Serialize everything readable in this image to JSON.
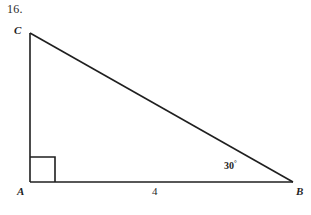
{
  "figure": {
    "problem_number": "16.",
    "background_color": "#ffffff",
    "stroke_color": "#1f1f1f",
    "vertices": {
      "c_label": "C",
      "a_label": "A",
      "b_label": "B"
    },
    "labels": {
      "side_ab_length": "4",
      "angle_at_b_value": "30",
      "angle_at_b_unit": "°",
      "right_angle_at_a": "right-angle-marker"
    },
    "geometry": {
      "apex_c": [
        30,
        33
      ],
      "vertex_a": [
        30,
        182
      ],
      "vertex_b": [
        293,
        182
      ],
      "right_angle_box_size": 25
    }
  }
}
